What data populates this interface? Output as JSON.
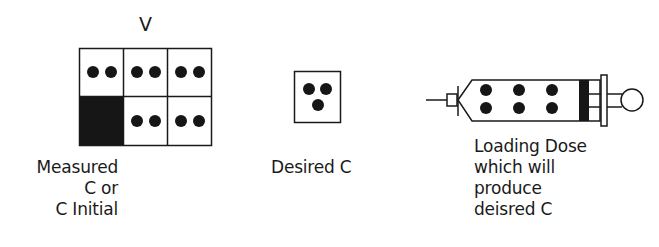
{
  "volume_panel": {
    "top_label": "V",
    "caption_lines": [
      "Measured",
      "C or",
      "C Initial"
    ],
    "grid": {
      "rows": 2,
      "cols": 3,
      "cells": [
        {
          "row": 0,
          "col": 0,
          "dots": 2,
          "filled": false
        },
        {
          "row": 0,
          "col": 1,
          "dots": 2,
          "filled": false
        },
        {
          "row": 0,
          "col": 2,
          "dots": 2,
          "filled": false
        },
        {
          "row": 1,
          "col": 0,
          "dots": 0,
          "filled": true
        },
        {
          "row": 1,
          "col": 1,
          "dots": 2,
          "filled": false
        },
        {
          "row": 1,
          "col": 2,
          "dots": 2,
          "filled": false
        }
      ]
    }
  },
  "desired_panel": {
    "caption": "Desired C",
    "dots": 3
  },
  "syringe_panel": {
    "caption_lines": [
      "Loading Dose",
      "which will",
      "produce",
      "deisred C"
    ],
    "dots": 6
  },
  "colors": {
    "ink": "#1a1a1a",
    "background": "#ffffff"
  }
}
